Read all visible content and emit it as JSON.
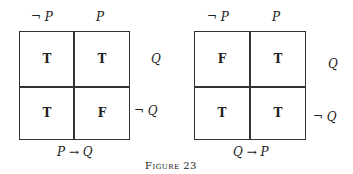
{
  "figure": {
    "caption": "Figure 23",
    "diagrams": [
      {
        "col_labels": [
          "¬ P",
          "P"
        ],
        "row_labels": [
          "Q",
          "¬ Q"
        ],
        "cells": [
          [
            "T",
            "T"
          ],
          [
            "T",
            "F"
          ]
        ],
        "title": "P → Q"
      },
      {
        "col_labels": [
          "¬ P",
          "P"
        ],
        "row_labels": [
          "Q",
          "¬ Q"
        ],
        "cells": [
          [
            "F",
            "T"
          ],
          [
            "T",
            "T"
          ]
        ],
        "title": "Q → P"
      }
    ]
  }
}
